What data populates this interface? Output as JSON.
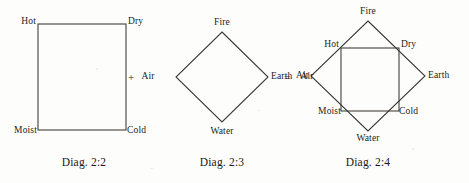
{
  "figure": {
    "background_color": "#fdfdfb",
    "ink_color": "#3a3734",
    "title_note": "Square of qualities combined with diamond of elements"
  },
  "diagrams": [
    {
      "id": "diag-2-2",
      "caption": "Diag. 2:2",
      "shape": "square",
      "labels": {
        "top_left": "Hot",
        "top_right": "Dry",
        "bottom_left": "Moist",
        "bottom_right": "Cold"
      },
      "geometry": {
        "x": 38,
        "y": 24,
        "width": 88,
        "height": 106
      },
      "caption_x": 84,
      "caption_y": 156
    },
    {
      "id": "diag-2-3",
      "caption": "Diag. 2:3",
      "shape": "diamond",
      "labels": {
        "top": "Fire",
        "left": "Air",
        "right": "Earth",
        "bottom": "Water"
      },
      "geometry": {
        "cx": 222,
        "cy": 77,
        "rx": 46,
        "ry": 45
      },
      "caption_x": 222,
      "caption_y": 156
    },
    {
      "id": "diag-2-4",
      "caption": "Diag. 2:4",
      "shape": "diamond-with-inscribed-square",
      "labels": {
        "top": "Fire",
        "left": "Air",
        "right": "Earth",
        "bottom": "Water",
        "top_left": "Hot",
        "top_right": "Dry",
        "bottom_left": "Moist",
        "bottom_right": "Cold"
      },
      "geometry": {
        "cx": 368,
        "cy": 76,
        "rx": 57,
        "ry": 55,
        "square": {
          "x": 341,
          "y": 48,
          "width": 58,
          "height": 63
        }
      },
      "caption_x": 368,
      "caption_y": 156
    }
  ],
  "operators": [
    {
      "id": "plus",
      "symbol": "+",
      "x": 131,
      "y": 77
    },
    {
      "id": "equals",
      "symbol": "=",
      "x": 287,
      "y": 77
    }
  ],
  "operator_labels": [
    {
      "id": "air-after-plus",
      "text": "Air",
      "x": 148,
      "y": 77
    },
    {
      "id": "air-after-equals",
      "text": "Air",
      "x": 306,
      "y": 77
    }
  ]
}
